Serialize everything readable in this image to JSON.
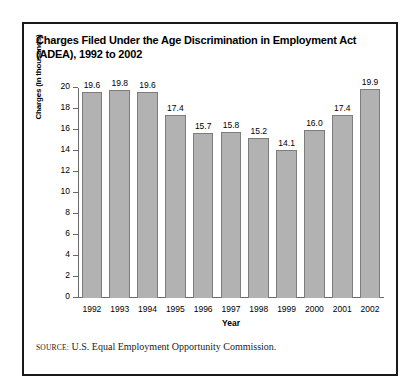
{
  "figure": {
    "title": "Charges Filed Under the Age Discrimination in Employment Act (ADEA), 1992 to 2002",
    "source_label": "SOURCE:",
    "source_text": "U.S. Equal Employment Opportunity Commission.",
    "border_color": "#1a1a1a"
  },
  "chart_data": {
    "type": "bar",
    "title": "Charges Filed Under the Age Discrimination in Employment Act (ADEA), 1992 to 2002",
    "xlabel": "Year",
    "ylabel": "Charges (in thousands)",
    "categories": [
      "1992",
      "1993",
      "1994",
      "1995",
      "1996",
      "1997",
      "1998",
      "1999",
      "2000",
      "2001",
      "2002"
    ],
    "values": [
      19.6,
      19.8,
      19.6,
      17.4,
      15.7,
      15.8,
      15.2,
      14.1,
      16.0,
      17.4,
      19.9
    ],
    "value_labels": [
      "19.6",
      "19.8",
      "19.6",
      "17.4",
      "15.7",
      "15.8",
      "15.2",
      "14.1",
      "16.0",
      "17.4",
      "19.9"
    ],
    "ylim": [
      0,
      20
    ],
    "ytick_values": [
      20,
      18,
      16,
      14,
      12,
      10,
      8,
      6,
      4,
      2,
      0
    ],
    "ytick_labels": [
      "20",
      "18",
      "16",
      "14",
      "12",
      "10",
      "8",
      "6",
      "4",
      "2",
      "0"
    ],
    "grid": false,
    "legend": null,
    "bar_color": "#b2b2b2",
    "bar_edge_color": "#7d7d7d",
    "axis_color": "#6a6a6a"
  }
}
